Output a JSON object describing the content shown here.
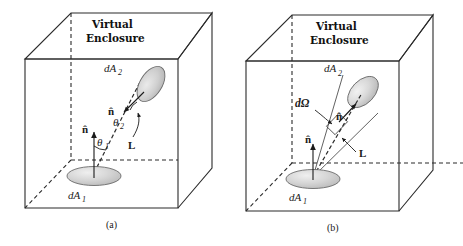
{
  "figure": {
    "title_text": "Virtual Enclosure",
    "panels": [
      {
        "id": "a",
        "caption": "(a)",
        "enclosure_label_line1": "Virtual",
        "enclosure_label_line2": "Enclosure",
        "labels": {
          "area_source": "dA",
          "area_source_sub": "1",
          "area_target": "dA",
          "area_target_sub": "2",
          "normal_source": "n̂",
          "normal_target": "n̂",
          "angle_source": "θ",
          "angle_source_sub": "1",
          "angle_target": "θ",
          "angle_target_sub": "2",
          "distance": "L"
        }
      },
      {
        "id": "b",
        "caption": "(b)",
        "enclosure_label_line1": "Virtual",
        "enclosure_label_line2": "Enclosure",
        "labels": {
          "area_source": "dA",
          "area_source_sub": "1",
          "area_target": "dA",
          "area_target_sub": "2",
          "normal_source": "n̂",
          "normal_cone": "n̂",
          "solid_angle": "dΩ",
          "distance": "L"
        }
      }
    ]
  },
  "colors": {
    "background": "#ffffff",
    "line": "#2b2b2b",
    "disc_fill": "#d2d2d2",
    "disc_stroke": "#6b6b6b",
    "text": "#1a1a1a"
  }
}
